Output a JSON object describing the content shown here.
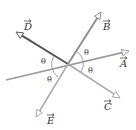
{
  "diagram": {
    "origin": {
      "x": 68,
      "y": 64
    },
    "vectors": [
      {
        "name": "A",
        "label": "A",
        "tail": {
          "x": 6,
          "y": 80
        },
        "tip": {
          "x": 129,
          "y": 51
        },
        "color": "#9a9a9a",
        "width": 1.6,
        "label_pos": {
          "x": 120,
          "y": 67
        }
      },
      {
        "name": "B",
        "label": "B",
        "tail": {
          "x": 68,
          "y": 64
        },
        "tip": {
          "x": 101,
          "y": 12
        },
        "color": "#8a8a8a",
        "width": 1.8,
        "label_pos": {
          "x": 103,
          "y": 30
        }
      },
      {
        "name": "C",
        "label": "C",
        "tail": {
          "x": 68,
          "y": 64
        },
        "tip": {
          "x": 120,
          "y": 98
        },
        "color": "#a8a8a8",
        "width": 1.5,
        "label_pos": {
          "x": 104,
          "y": 110
        }
      },
      {
        "name": "D",
        "label": "D",
        "tail": {
          "x": 68,
          "y": 64
        },
        "tip": {
          "x": 16,
          "y": 32
        },
        "color": "#555555",
        "width": 2.0,
        "label_pos": {
          "x": 24,
          "y": 30
        }
      },
      {
        "name": "E",
        "label": "E",
        "tail": {
          "x": 68,
          "y": 64
        },
        "tip": {
          "x": 36,
          "y": 117
        },
        "color": "#aaaaaa",
        "width": 1.5,
        "label_pos": {
          "x": 47,
          "y": 124
        }
      }
    ],
    "angles": [
      {
        "symbol": "θ",
        "x": 41,
        "y": 64
      },
      {
        "symbol": "θ",
        "x": 84,
        "y": 55
      },
      {
        "symbol": "θ",
        "x": 88,
        "y": 73
      },
      {
        "symbol": "θ",
        "x": 47,
        "y": 82
      }
    ],
    "arc_color": "#777777"
  }
}
